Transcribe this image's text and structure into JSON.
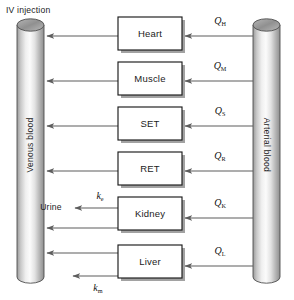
{
  "figure": {
    "type": "pbpk-compartment-diagram",
    "caption_top_left": "IV injection",
    "background_color": "#ffffff",
    "line_color": "#5d5d5d",
    "box_stroke_color": "#1a1a1a",
    "text_color": "#1b1b1b"
  },
  "vessels": {
    "venous": {
      "label": "Venous blood",
      "side": "left",
      "orientation": "vertical-bottom-to-top"
    },
    "arterial": {
      "label": "Arterial blood",
      "side": "right",
      "orientation": "vertical-top-to-bottom"
    }
  },
  "compartments": [
    {
      "id": "heart",
      "label": "Heart",
      "flow_symbol": "Q",
      "flow_subscript": "H",
      "flow_label": "QH"
    },
    {
      "id": "muscle",
      "label": "Muscle",
      "flow_symbol": "Q",
      "flow_subscript": "M",
      "flow_label": "QM"
    },
    {
      "id": "set",
      "label": "SET",
      "flow_symbol": "Q",
      "flow_subscript": "S",
      "flow_label": "QS"
    },
    {
      "id": "ret",
      "label": "RET",
      "flow_symbol": "Q",
      "flow_subscript": "R",
      "flow_label": "QR"
    },
    {
      "id": "kidney",
      "label": "Kidney",
      "flow_symbol": "Q",
      "flow_subscript": "K",
      "flow_label": "QK"
    },
    {
      "id": "liver",
      "label": "Liver",
      "flow_symbol": "Q",
      "flow_subscript": "L",
      "flow_label": "QL"
    }
  ],
  "elimination": {
    "urine": {
      "label": "Urine",
      "rate_symbol": "k",
      "rate_subscript": "e",
      "rate_label": "ke",
      "from": "kidney"
    },
    "metabolism": {
      "rate_symbol": "k",
      "rate_subscript": "m",
      "rate_label": "km",
      "from": "liver"
    }
  }
}
